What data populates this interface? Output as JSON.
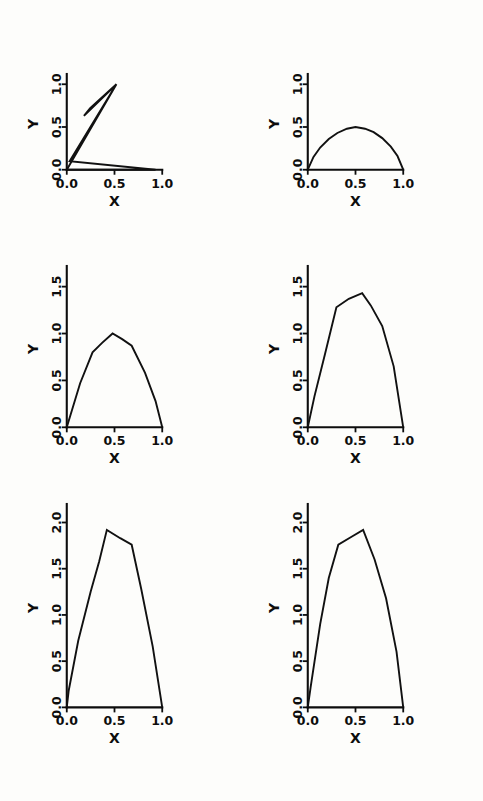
{
  "figure": {
    "title": "",
    "background_color": "#fdfdfb",
    "line_color": "#111111",
    "panel_count": 6,
    "layout": "3 rows x 2 columns"
  },
  "chart_data": [
    {
      "id": "panel-1",
      "type": "line",
      "title": "",
      "xlabel": "X",
      "ylabel": "Y",
      "xlim": [
        -0.05,
        1.05
      ],
      "ylim": [
        -0.05,
        1.12
      ],
      "xticks": [
        0.0,
        0.5,
        1.0
      ],
      "xticklabels": [
        "0.0",
        "0.5",
        "1.0"
      ],
      "yticks": [
        0.0,
        0.5,
        1.0
      ],
      "yticklabels": [
        "0.0",
        "0.5",
        "1.0"
      ],
      "grid": false,
      "legend": null,
      "series": [
        {
          "name": "curve",
          "x": [
            0.0,
            0.52,
            0.18,
            0.245,
            0.52,
            0.03,
            0.93,
            0.0
          ],
          "y": [
            0.0,
            1.0,
            0.63,
            0.72,
            1.0,
            0.1,
            0.0,
            0.0
          ]
        }
      ]
    },
    {
      "id": "panel-2",
      "type": "line",
      "title": "",
      "xlabel": "X",
      "ylabel": "Y",
      "xlim": [
        -0.05,
        1.05
      ],
      "ylim": [
        -0.05,
        1.12
      ],
      "xticks": [
        0.0,
        0.5,
        1.0
      ],
      "xticklabels": [
        "0.0",
        "0.5",
        "1.0"
      ],
      "yticks": [
        0.0,
        0.5,
        1.0
      ],
      "yticklabels": [
        "0.0",
        "0.5",
        "1.0"
      ],
      "grid": false,
      "legend": null,
      "series": [
        {
          "name": "curve",
          "x": [
            0.0,
            0.06,
            0.13,
            0.22,
            0.31,
            0.41,
            0.5,
            0.6,
            0.69,
            0.78,
            0.87,
            0.94,
            1.0
          ],
          "y": [
            0.0,
            0.15,
            0.26,
            0.36,
            0.43,
            0.48,
            0.5,
            0.48,
            0.44,
            0.37,
            0.27,
            0.16,
            0.0
          ]
        }
      ]
    },
    {
      "id": "panel-3",
      "type": "line",
      "title": "",
      "xlabel": "X",
      "ylabel": "Y",
      "xlim": [
        -0.05,
        1.05
      ],
      "ylim": [
        -0.05,
        1.72
      ],
      "xticks": [
        0.0,
        0.5,
        1.0
      ],
      "xticklabels": [
        "0.0",
        "0.5",
        "1.0"
      ],
      "yticks": [
        0.0,
        0.5,
        1.0,
        1.5
      ],
      "yticklabels": [
        "0.0",
        "0.5",
        "1.0",
        "1.5"
      ],
      "grid": false,
      "legend": null,
      "series": [
        {
          "name": "curve",
          "x": [
            0.0,
            0.14,
            0.27,
            0.37,
            0.48,
            0.58,
            0.68,
            0.82,
            0.93,
            1.0
          ],
          "y": [
            0.0,
            0.47,
            0.8,
            0.9,
            1.0,
            0.94,
            0.87,
            0.58,
            0.28,
            0.0
          ]
        }
      ]
    },
    {
      "id": "panel-4",
      "type": "line",
      "title": "",
      "xlabel": "X",
      "ylabel": "Y",
      "xlim": [
        -0.05,
        1.05
      ],
      "ylim": [
        -0.05,
        1.72
      ],
      "xticks": [
        0.0,
        0.5,
        1.0
      ],
      "xticklabels": [
        "0.0",
        "0.5",
        "1.0"
      ],
      "yticks": [
        0.0,
        0.5,
        1.0,
        1.5
      ],
      "yticklabels": [
        "0.0",
        "0.5",
        "1.0",
        "1.5"
      ],
      "grid": false,
      "legend": null,
      "series": [
        {
          "name": "curve",
          "x": [
            0.0,
            0.07,
            0.18,
            0.3,
            0.43,
            0.57,
            0.66,
            0.78,
            0.9,
            1.0
          ],
          "y": [
            0.0,
            0.33,
            0.78,
            1.28,
            1.37,
            1.43,
            1.3,
            1.08,
            0.65,
            0.0
          ]
        }
      ]
    },
    {
      "id": "panel-5",
      "type": "line",
      "title": "",
      "xlabel": "X",
      "ylabel": "Y",
      "xlim": [
        -0.05,
        1.05
      ],
      "ylim": [
        -0.05,
        2.2
      ],
      "xticks": [
        0.0,
        0.5,
        1.0
      ],
      "xticklabels": [
        "0.0",
        "0.5",
        "1.0"
      ],
      "yticks": [
        0.0,
        0.5,
        1.0,
        1.5,
        2.0
      ],
      "yticklabels": [
        "0.0",
        "0.5",
        "1.0",
        "1.5",
        "2.0"
      ],
      "grid": false,
      "legend": null,
      "series": [
        {
          "name": "curve",
          "x": [
            0.0,
            0.02,
            0.12,
            0.25,
            0.34,
            0.42,
            0.56,
            0.68,
            0.78,
            0.9,
            1.0
          ],
          "y": [
            0.0,
            0.18,
            0.72,
            1.25,
            1.58,
            1.92,
            1.83,
            1.76,
            1.28,
            0.66,
            0.0
          ]
        }
      ]
    },
    {
      "id": "panel-6",
      "type": "line",
      "title": "",
      "xlabel": "X",
      "ylabel": "Y",
      "xlim": [
        -0.05,
        1.05
      ],
      "ylim": [
        -0.05,
        2.2
      ],
      "xticks": [
        0.0,
        0.5,
        1.0
      ],
      "xticklabels": [
        "0.0",
        "0.5",
        "1.0"
      ],
      "yticks": [
        0.0,
        0.5,
        1.0,
        1.5,
        2.0
      ],
      "yticklabels": [
        "0.0",
        "0.5",
        "1.0",
        "1.5",
        "2.0"
      ],
      "grid": false,
      "legend": null,
      "series": [
        {
          "name": "curve",
          "x": [
            0.0,
            0.03,
            0.13,
            0.22,
            0.32,
            0.45,
            0.58,
            0.7,
            0.82,
            0.93,
            1.0
          ],
          "y": [
            0.0,
            0.22,
            0.9,
            1.4,
            1.76,
            1.84,
            1.92,
            1.6,
            1.18,
            0.6,
            0.0
          ]
        }
      ]
    }
  ]
}
